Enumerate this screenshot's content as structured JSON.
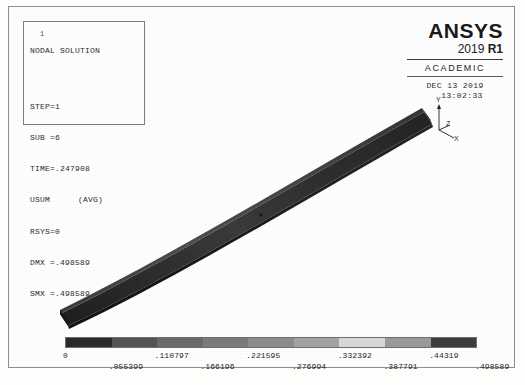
{
  "window": {
    "app_name": "ANSYS",
    "background_color": "#fdfdfc",
    "frame_color": "#8e8e8e"
  },
  "info_box": {
    "corner_tick": "1",
    "title": "NODAL SOLUTION",
    "lines": [
      "STEP=1",
      "SUB =6",
      "TIME=.247908",
      "USUM",
      "RSYS=0",
      "DMX =.498589",
      "SMX =.498589"
    ],
    "usum_qualifier": "(AVG)",
    "step": "STEP=1",
    "sub": "SUB =6",
    "time": "TIME=.247908",
    "usum": "USUM",
    "rsys": "RSYS=0",
    "dmx": "DMX =.498589",
    "smx": "SMX =.498589"
  },
  "brand": {
    "name": "ANSYS",
    "version_year": "2019 ",
    "version_release": "R1",
    "license": "ACADEMIC",
    "date": "DEC 13 2019",
    "time": "13:02:33"
  },
  "triad": {
    "y_label": "Y",
    "x_label": "X",
    "z_label": "Z"
  },
  "chart_data": {
    "type": "heatmap",
    "title": "NODAL SOLUTION",
    "quantity": "USUM",
    "units_note": "",
    "xlabel": "",
    "ylabel": "",
    "min": 0,
    "max": 0.498589,
    "n_bands": 9,
    "tick_labels": [
      "0",
      ".055399",
      ".110797",
      ".166196",
      ".221595",
      ".276994",
      ".332392",
      ".387791",
      ".44319",
      ".498589"
    ],
    "tick_values": [
      0,
      0.055399,
      0.110797,
      0.166196,
      0.221595,
      0.276994,
      0.332392,
      0.387791,
      0.44319,
      0.498589
    ],
    "band_colors": [
      "#2a2a2a",
      "#545454",
      "#6b6b6b",
      "#7b7b7b",
      "#8d8d8d",
      "#a3a3a3",
      "#d8d8d8",
      "#9a9a9a",
      "#3d3d3d"
    ],
    "legend_position": "bottom",
    "grid": false
  }
}
